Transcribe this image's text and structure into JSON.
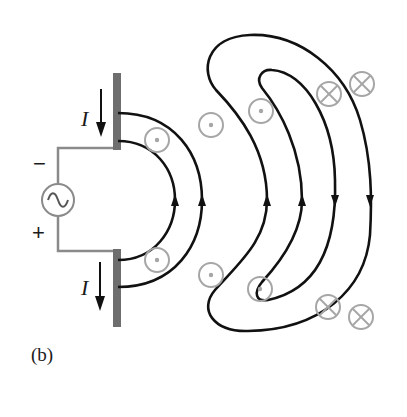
{
  "figure": {
    "caption": "(b)",
    "current_label_top": "I",
    "current_label_bottom": "I",
    "minus_sign": "−",
    "plus_sign": "+",
    "source_symbol": "~",
    "colors": {
      "field_line": "#111111",
      "conductor": "#6e6e6e",
      "wire": "#888888",
      "symbol": "#a6a6a6"
    }
  },
  "elements": {
    "source": {
      "type": "ac-voltage-source",
      "glyph": "sine-wave-icon"
    },
    "antenna": {
      "type": "dipole",
      "arms": 2
    },
    "field_lines": {
      "inner_loops": 2,
      "detached_loops": 2,
      "arrow_direction_inner": "up",
      "arrow_direction_outer": "down"
    },
    "field_symbols": [
      {
        "kind": "out-of-page",
        "icon": "dot-circle-icon"
      },
      {
        "kind": "out-of-page",
        "icon": "dot-circle-icon"
      },
      {
        "kind": "out-of-page",
        "icon": "dot-circle-icon"
      },
      {
        "kind": "out-of-page",
        "icon": "dot-circle-icon"
      },
      {
        "kind": "out-of-page",
        "icon": "dot-circle-icon"
      },
      {
        "kind": "out-of-page",
        "icon": "dot-circle-icon"
      },
      {
        "kind": "into-page",
        "icon": "cross-circle-icon"
      },
      {
        "kind": "into-page",
        "icon": "cross-circle-icon"
      },
      {
        "kind": "into-page",
        "icon": "cross-circle-icon"
      },
      {
        "kind": "into-page",
        "icon": "cross-circle-icon"
      }
    ]
  }
}
